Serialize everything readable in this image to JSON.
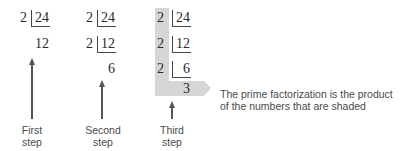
{
  "steps": [
    {
      "label_line1": "First",
      "label_line2": "step",
      "rows": [
        {
          "divisor": "2",
          "dividend": "24"
        }
      ],
      "result": "12"
    },
    {
      "label_line1": "Second",
      "label_line2": "step",
      "rows": [
        {
          "divisor": "2",
          "dividend": "24"
        },
        {
          "divisor": "2",
          "dividend": "12"
        }
      ],
      "result": "6"
    },
    {
      "label_line1": "Third",
      "label_line2": "step",
      "rows": [
        {
          "divisor": "2",
          "dividend": "24"
        },
        {
          "divisor": "2",
          "dividend": "12"
        },
        {
          "divisor": "2",
          "dividend": "6"
        }
      ],
      "result": "3"
    }
  ],
  "note": {
    "line1": "The prime factorization is the product",
    "line2": "of the numbers that are shaded"
  },
  "colors": {
    "shade": "#d6d6d6",
    "text": "#2a2a2a"
  }
}
